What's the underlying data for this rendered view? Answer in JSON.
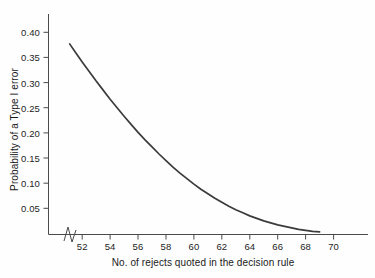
{
  "chart_data": {
    "type": "line",
    "title": "",
    "xlabel": "No. of rejects quoted in the decision rule",
    "ylabel": "Probability of a Type I error",
    "xlim": [
      50.6,
      71.6
    ],
    "ylim": [
      0,
      0.425
    ],
    "grid": false,
    "legend": null,
    "axis_break": {
      "axis": "x",
      "marker": "zigzag",
      "note": "x axis broken between origin and first tick"
    },
    "xticks": [
      52,
      54,
      56,
      58,
      60,
      62,
      64,
      66,
      68,
      70
    ],
    "xtick_labels": [
      "52",
      "54",
      "56",
      "58",
      "60",
      "62",
      "64",
      "66",
      "68",
      "70"
    ],
    "yticks": [
      0.05,
      0.1,
      0.15,
      0.2,
      0.25,
      0.3,
      0.35,
      0.4
    ],
    "ytick_labels": [
      "0.05",
      "0.10",
      "0.15",
      "0.20",
      "0.25",
      "0.30",
      "0.35",
      "0.40"
    ],
    "series": [
      {
        "name": "Probability of a Type I error",
        "color": "#3b3b3b",
        "x": [
          51.1,
          51.5,
          52.0,
          52.5,
          53.0,
          53.5,
          54.0,
          54.5,
          55.0,
          55.5,
          56.0,
          56.5,
          57.0,
          57.5,
          58.0,
          58.5,
          59.0,
          59.5,
          60.0,
          60.5,
          61.0,
          61.5,
          62.0,
          62.5,
          63.0,
          63.5,
          64.0,
          64.5,
          65.0,
          65.5,
          66.0,
          66.5,
          67.0,
          67.5,
          68.0,
          68.5,
          69.0
        ],
        "y": [
          0.377,
          0.361,
          0.341,
          0.322,
          0.303,
          0.285,
          0.267,
          0.25,
          0.233,
          0.217,
          0.201,
          0.186,
          0.172,
          0.158,
          0.145,
          0.132,
          0.12,
          0.109,
          0.098,
          0.088,
          0.079,
          0.07,
          0.062,
          0.054,
          0.047,
          0.041,
          0.035,
          0.03,
          0.025,
          0.021,
          0.017,
          0.014,
          0.011,
          0.008,
          0.006,
          0.004,
          0.003
        ]
      }
    ]
  },
  "axes": {
    "y_title": "Probability of a Type I error",
    "x_title": "No. of rejects quoted in the decision rule",
    "y_tick_labels": [
      "0.40",
      "0.35",
      "0.30",
      "0.25",
      "0.20",
      "0.15",
      "0.10",
      "0.05"
    ],
    "x_tick_labels": [
      "52",
      "54",
      "56",
      "58",
      "60",
      "62",
      "64",
      "66",
      "68",
      "70"
    ]
  },
  "colors": {
    "background": "#fefefe",
    "axis": "#4a4a4a",
    "curve": "#3b3b3b",
    "text": "#1d1d1d"
  }
}
